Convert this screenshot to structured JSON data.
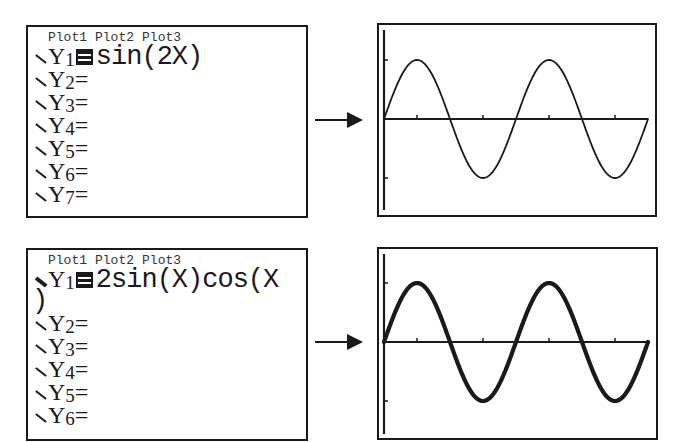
{
  "panels": [
    {
      "editor": {
        "plots": [
          "Plot1",
          "Plot2",
          "Plot3"
        ],
        "rows": [
          {
            "name": "Y",
            "sub": "1",
            "selected_eq": true,
            "expr": "sin(2X)",
            "style": "thin"
          },
          {
            "name": "Y",
            "sub": "2",
            "eq": "=",
            "expr": ""
          },
          {
            "name": "Y",
            "sub": "3",
            "eq": "=",
            "expr": ""
          },
          {
            "name": "Y",
            "sub": "4",
            "eq": "=",
            "expr": ""
          },
          {
            "name": "Y",
            "sub": "5",
            "eq": "=",
            "expr": ""
          },
          {
            "name": "Y",
            "sub": "6",
            "eq": "=",
            "expr": ""
          },
          {
            "name": "Y",
            "sub": "7",
            "eq": "=",
            "expr": ""
          }
        ]
      },
      "arrow": "right-arrow",
      "graph": {
        "function": "sin(2X)",
        "line_style": "thin"
      }
    },
    {
      "editor": {
        "plots": [
          "Plot1",
          "Plot2",
          "Plot3"
        ],
        "rows": [
          {
            "name": "Y",
            "sub": "1",
            "selected_eq": true,
            "expr": "2sin(X)cos(X",
            "continuation": ")",
            "style": "thick"
          },
          {
            "name": "Y",
            "sub": "2",
            "eq": "=",
            "expr": ""
          },
          {
            "name": "Y",
            "sub": "3",
            "eq": "=",
            "expr": ""
          },
          {
            "name": "Y",
            "sub": "4",
            "eq": "=",
            "expr": ""
          },
          {
            "name": "Y",
            "sub": "5",
            "eq": "=",
            "expr": ""
          },
          {
            "name": "Y",
            "sub": "6",
            "eq": "=",
            "expr": ""
          }
        ]
      },
      "arrow": "right-arrow",
      "graph": {
        "function": "2sin(X)cos(X)",
        "line_style": "thick"
      }
    }
  ],
  "chart_data": [
    {
      "type": "line",
      "title": "",
      "series": [
        {
          "name": "Y1 = sin(2X)",
          "function": "sin(2X)",
          "line_width": "thin"
        }
      ],
      "x_range": [
        0,
        6.283
      ],
      "ylim": [
        -1.5,
        1.5
      ],
      "x_ticks": [
        0.785,
        1.571,
        2.356,
        3.142,
        3.927,
        4.712,
        5.498
      ],
      "y_ticks": [
        -1,
        1
      ],
      "grid": false
    },
    {
      "type": "line",
      "title": "",
      "series": [
        {
          "name": "Y1 = 2sin(X)cos(X)",
          "function": "2sin(X)cos(X)",
          "line_width": "thick"
        }
      ],
      "x_range": [
        0,
        6.283
      ],
      "ylim": [
        -1.5,
        1.5
      ],
      "x_ticks": [
        0.785,
        1.571,
        2.356,
        3.142,
        3.927,
        4.712,
        5.498
      ],
      "y_ticks": [
        -1,
        1
      ],
      "grid": false
    }
  ]
}
